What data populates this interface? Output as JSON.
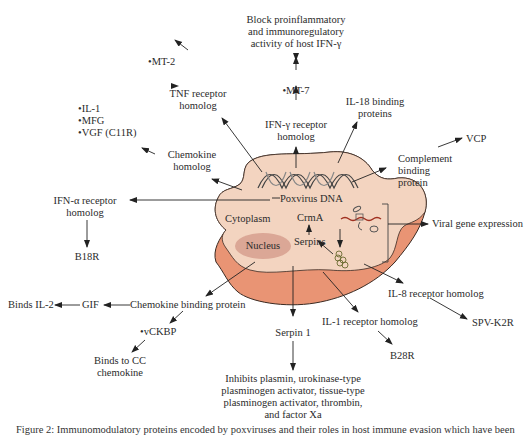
{
  "diagram": {
    "cell": {
      "dna_label": "Poxvirus DNA",
      "cytoplasm_label": "Cytoplasm",
      "nucleus_label": "Nucleus",
      "crma_label": "CrmA",
      "serpins_label": "Serpins",
      "colors": {
        "cytoplasm_fill": "#f3d3bf",
        "outer_fill": "#e89476",
        "nucleus_fill": "#d9a896",
        "outline": "#3a2a22"
      }
    },
    "top": {
      "block_text": [
        "Block proinflammatory",
        "and immunoregulatory",
        "activity of host IFN-γ"
      ],
      "mt7": "•MT-7",
      "ifn_gamma": [
        "IFN-γ receptor",
        "homolog"
      ],
      "il18": [
        "IL-18 binding",
        "proteins"
      ]
    },
    "left": {
      "mt2": "•MT-2",
      "tnf": [
        "TNF receptor",
        "homolog"
      ],
      "bullets": [
        "•IL-1",
        "•MFG",
        "•VGF (C11R)"
      ],
      "chemokine_homolog": [
        "Chemokine",
        "homolog"
      ],
      "ifn_alpha": [
        "IFN-α receptor",
        "homolog"
      ],
      "b18r": "B18R"
    },
    "right": {
      "vcp": "VCP",
      "complement": [
        "Complement",
        "binding",
        "protein"
      ],
      "viral_gene": "Viral gene expression",
      "il8": "IL-8 receptor homolog",
      "spv": "SPV-K2R"
    },
    "bottom": {
      "binds_il2": "Binds IL-2",
      "gif": "GIF",
      "chemokine_binding": "Chemokine binding protein",
      "vckbp": "•vCKBP",
      "binds_cc": [
        "Binds to CC",
        "chemokine"
      ],
      "serpin1": "Serpin 1",
      "inhibits": [
        "Inhibits plasmin, urokinase-type",
        "plasminogen activator, tissue-type",
        "plasminogen activator, thrombin,",
        "and factor Xa"
      ],
      "il1": "IL-1 receptor homolog",
      "b28r": "B28R"
    },
    "caption_partial": "Figure 2: Immunomodulatory proteins encoded by poxviruses and their roles in host immune evasion which have been"
  }
}
